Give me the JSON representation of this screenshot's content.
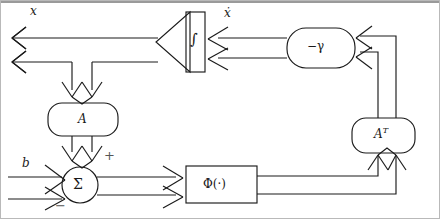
{
  "figure": {
    "type": "block-diagram",
    "width": 440,
    "height": 219,
    "stroke_color": "#1a1a1a",
    "background_color": "#ffffff",
    "border_color": "#b9b9b9"
  },
  "labels": {
    "output_signal": "x",
    "derivative_signal": "ẋ",
    "input_signal": "b",
    "plus_sign": "+",
    "minus_sign": "−"
  },
  "blocks": [
    {
      "id": "integrator",
      "name": "integrator-block",
      "label": "∫",
      "shape": "triangle-with-bar",
      "x": 155,
      "y": 12,
      "width": 50,
      "height": 60
    },
    {
      "id": "gamma",
      "name": "leak-gain-block",
      "label": "−γ",
      "shape": "rounded-rect",
      "x": 287,
      "y": 28,
      "width": 68,
      "height": 40
    },
    {
      "id": "matrix_a",
      "name": "matrix-a-block",
      "label": "A",
      "shape": "rounded-rect",
      "x": 48,
      "y": 103,
      "width": 70,
      "height": 33
    },
    {
      "id": "matrix_at",
      "name": "matrix-a-transpose-block",
      "label": "A",
      "superscript": "T",
      "shape": "rounded-rect",
      "x": 352,
      "y": 118,
      "width": 63,
      "height": 35
    },
    {
      "id": "phi",
      "name": "nonlinearity-block",
      "label": "Φ(·)",
      "shape": "rect",
      "x": 186,
      "y": 166,
      "width": 71,
      "height": 37
    },
    {
      "id": "summer",
      "name": "summing-junction",
      "label": "Σ",
      "shape": "circle",
      "cx": 80,
      "cy": 185,
      "r": 18
    }
  ],
  "connections": [
    {
      "name": "integrator-to-output-bus",
      "from": "integrator",
      "to": "x-output",
      "style": "bus-arrow-left"
    },
    {
      "name": "output-bus-to-matrix-a",
      "from": "x-output",
      "to": "matrix_a",
      "style": "bus-arrow-down"
    },
    {
      "name": "matrix-a-to-summer",
      "from": "matrix_a",
      "to": "summer",
      "style": "bus-arrow-down",
      "sign": "+"
    },
    {
      "name": "b-input-to-summer",
      "from": "b",
      "to": "summer",
      "style": "bus-arrow-right",
      "sign": "−"
    },
    {
      "name": "summer-to-phi",
      "from": "summer",
      "to": "phi",
      "style": "bus-arrow-right"
    },
    {
      "name": "phi-to-matrix-a-transpose",
      "from": "phi",
      "to": "matrix_at",
      "style": "bus-arrow-up"
    },
    {
      "name": "matrix-a-transpose-to-gamma",
      "from": "matrix_at",
      "to": "gamma",
      "style": "bus-arrow-left"
    },
    {
      "name": "gamma-to-integrator",
      "from": "gamma",
      "to": "integrator",
      "style": "bus-arrow-left"
    }
  ]
}
